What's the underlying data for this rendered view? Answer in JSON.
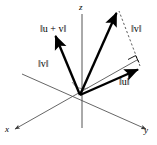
{
  "figure": {
    "background_color": "#ffffff",
    "stroke_color": "#000000",
    "axis_color": "#444444",
    "width": 157,
    "height": 145,
    "axes": [
      {
        "name": "x",
        "label": "x"
      },
      {
        "name": "y",
        "label": "y"
      },
      {
        "name": "z",
        "label": "z"
      }
    ],
    "labels": {
      "u_plus_v": "‖u + v‖",
      "v_right": "‖v‖",
      "v_left": "‖v‖",
      "u": "‖u‖",
      "axis_x": "x",
      "axis_y": "y",
      "axis_z": "z"
    },
    "vectors": [
      {
        "name": "v-left",
        "label": "‖v‖",
        "origin": [
          80,
          95
        ],
        "tip": [
          54,
          33
        ],
        "style": "solid-thick-arrow"
      },
      {
        "name": "u-plus-v",
        "label": "‖u + v‖",
        "origin": [
          80,
          95
        ],
        "tip": [
          118,
          9
        ],
        "style": "solid-thick-arrow"
      },
      {
        "name": "u",
        "label": "‖u‖",
        "origin": [
          80,
          95
        ],
        "tip": [
          141,
          68
        ],
        "style": "solid-thick-arrow"
      },
      {
        "name": "v-translated",
        "label": "‖v‖",
        "origin": [
          141,
          68
        ],
        "tip": [
          118,
          9
        ],
        "style": "dashed-thin"
      }
    ],
    "marks": [
      {
        "name": "right-angle-mark",
        "at": [
          134,
          58
        ]
      },
      {
        "name": "angle-arc-mark",
        "at": [
          86,
          83
        ]
      }
    ]
  }
}
